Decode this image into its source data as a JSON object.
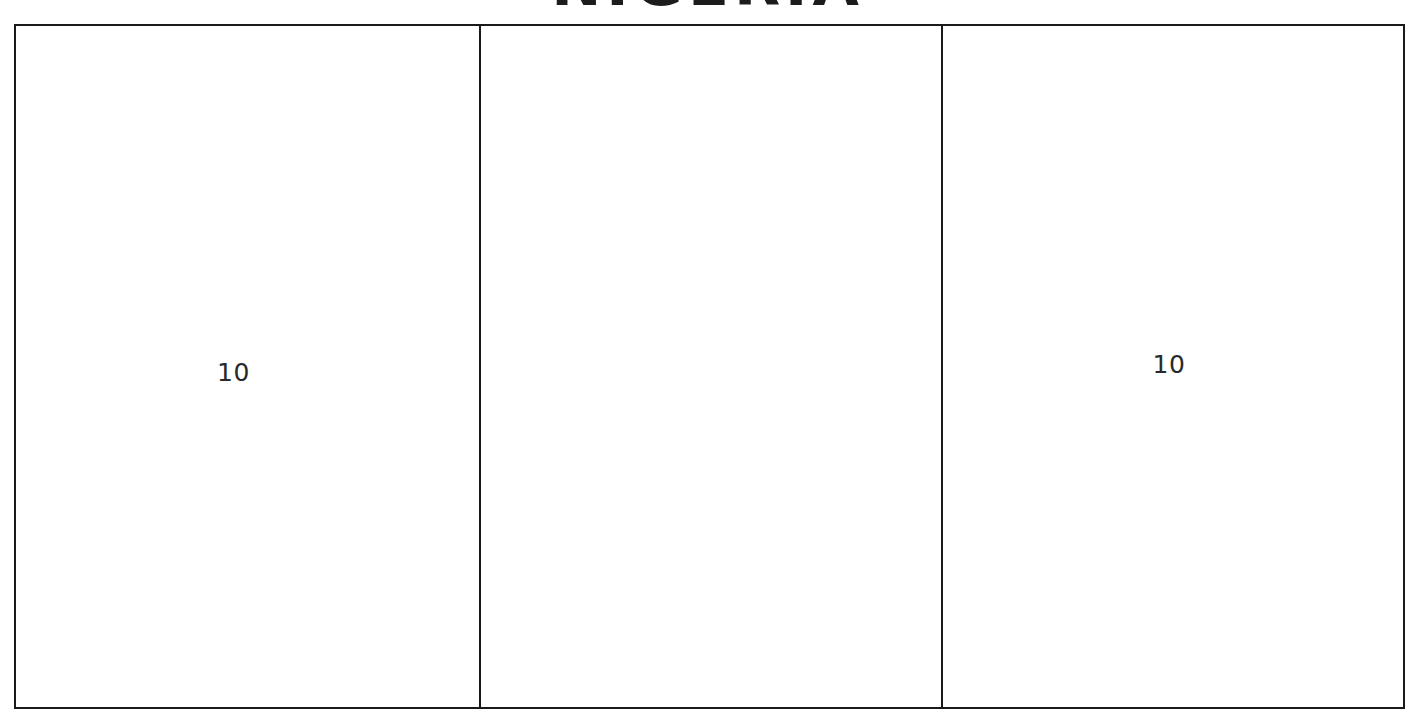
{
  "title": {
    "text": "NIGERIA"
  },
  "diagram": {
    "type": "flag-proportion-diagram",
    "bands": [
      {
        "name": "hoist-band",
        "measure": "10"
      },
      {
        "name": "middle-band",
        "measure": ""
      },
      {
        "name": "fly-band",
        "measure": "10"
      }
    ]
  },
  "colors": {
    "outline": "#1a1a1a",
    "fill": "#ffffff",
    "label_text": "#2a2a2a",
    "title_text": "#1c1c1c"
  }
}
